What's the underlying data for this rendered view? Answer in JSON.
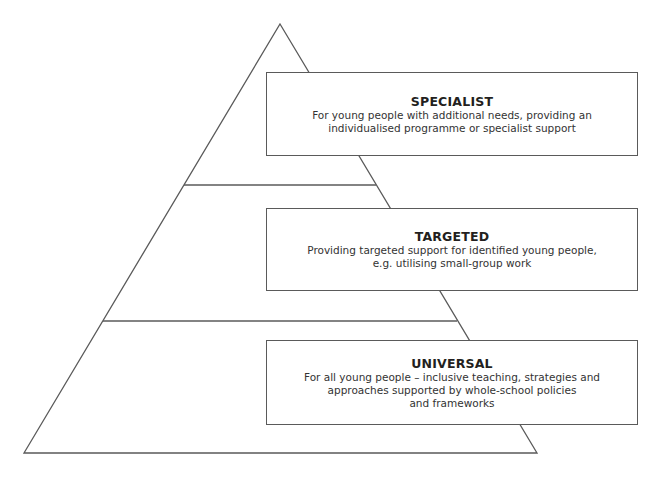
{
  "diagram": {
    "type": "pyramid",
    "line_color": "#5a5a5a",
    "tiers": [
      {
        "id": "specialist",
        "title": "SPECIALIST",
        "description": "For young people with additional needs, providing an\nindividualised programme or specialist support"
      },
      {
        "id": "targeted",
        "title": "TARGETED",
        "description": "Providing targeted support for identified young people,\ne.g. utilising small-group work"
      },
      {
        "id": "universal",
        "title": "UNIVERSAL",
        "description": "For all young people – inclusive teaching, strategies and\napproaches supported by whole-school policies\nand frameworks"
      }
    ]
  }
}
